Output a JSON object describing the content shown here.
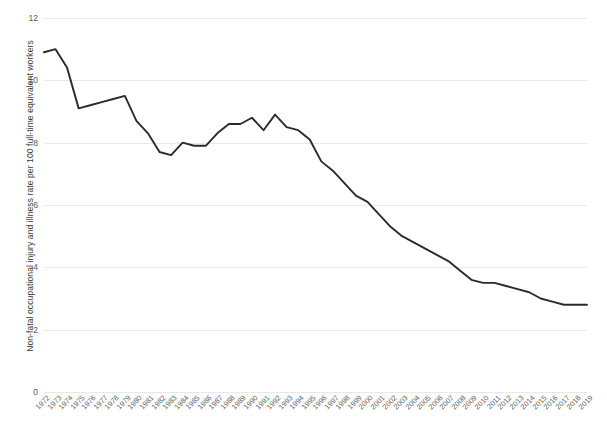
{
  "chart_data": {
    "type": "line",
    "title": "",
    "xlabel": "",
    "ylabel": "Non-fatal occupational injury and illness rate per 100 full-time equivalent workers",
    "ylim": [
      0,
      12
    ],
    "yticks": [
      0,
      2,
      4,
      6,
      8,
      10,
      12
    ],
    "grid": true,
    "legend": "none",
    "line_color": "#2b2b2b",
    "categories": [
      "1972",
      "1973",
      "1974",
      "1975",
      "1976",
      "1977",
      "1978",
      "1979",
      "1980",
      "1981",
      "1982",
      "1983",
      "1984",
      "1985",
      "1986",
      "1987",
      "1988",
      "1989",
      "1990",
      "1991",
      "1992",
      "1993",
      "1994",
      "1995",
      "1996",
      "1997",
      "1998",
      "1999",
      "2000",
      "2001",
      "2002",
      "2003",
      "2004",
      "2005",
      "2006",
      "2007",
      "2008",
      "2009",
      "2010",
      "2011",
      "2012",
      "2013",
      "2014",
      "2015",
      "2016",
      "2017",
      "2018",
      "2019"
    ],
    "values": [
      10.9,
      11.0,
      10.4,
      9.1,
      9.2,
      9.3,
      9.4,
      9.5,
      8.7,
      8.3,
      7.7,
      7.6,
      8.0,
      7.9,
      7.9,
      8.3,
      8.6,
      8.6,
      8.8,
      8.4,
      8.9,
      8.5,
      8.4,
      8.1,
      7.4,
      7.1,
      6.7,
      6.3,
      6.1,
      5.7,
      5.3,
      5.0,
      4.8,
      4.6,
      4.4,
      4.2,
      3.9,
      3.6,
      3.5,
      3.5,
      3.4,
      3.3,
      3.2,
      3.0,
      2.9,
      2.8,
      2.8,
      2.8
    ]
  }
}
